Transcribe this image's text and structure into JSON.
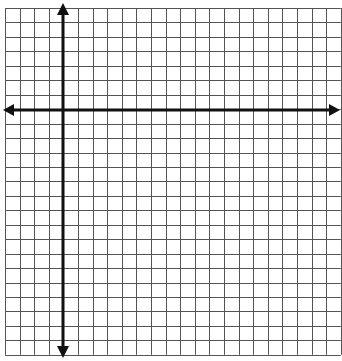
{
  "diagram": {
    "type": "coordinate-plane",
    "grid": {
      "columns": 23,
      "rows": 24,
      "left": 5,
      "top": 8,
      "cell_width": 14.6,
      "cell_height": 14.45,
      "line_color": "#555555",
      "line_width": 1
    },
    "axes": {
      "color": "#111111",
      "width": 3,
      "y_axis_column": 4,
      "x_axis_row": 7,
      "arrows": [
        "left",
        "right",
        "up",
        "down"
      ]
    },
    "background": "#ffffff"
  }
}
